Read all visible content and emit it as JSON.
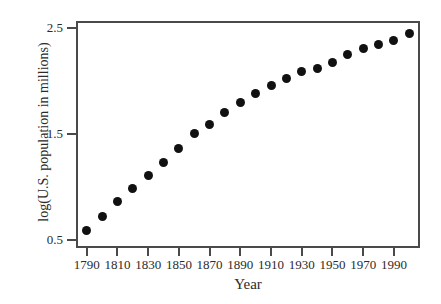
{
  "chart_data": {
    "type": "scatter",
    "title": "",
    "xlabel": "Year",
    "ylabel": "log(U.S. population in millions)",
    "xlim": [
      1783,
      2007
    ],
    "ylim": [
      0.42,
      2.57
    ],
    "grid": false,
    "legend": null,
    "marker": {
      "shape": "circle",
      "color": "#111111",
      "size_px": 9
    },
    "axis_color": "#4a4a4a",
    "background_color": "#ffffff",
    "xticks": [
      1790,
      1810,
      1830,
      1850,
      1870,
      1890,
      1910,
      1930,
      1950,
      1970,
      1990
    ],
    "xtick_labels": [
      "1790",
      "1810",
      "1830",
      "1850",
      "1870",
      "1890",
      "1910",
      "1930",
      "1950",
      "1970",
      "1990"
    ],
    "yticks": [
      0.5,
      1.5,
      2.5
    ],
    "ytick_labels": [
      "0.5",
      "1.5",
      "2.5"
    ],
    "x": [
      1790,
      1800,
      1810,
      1820,
      1830,
      1840,
      1850,
      1860,
      1870,
      1880,
      1890,
      1900,
      1910,
      1920,
      1930,
      1940,
      1950,
      1960,
      1970,
      1980,
      1990,
      2000
    ],
    "y": [
      0.59,
      0.72,
      0.86,
      0.98,
      1.11,
      1.23,
      1.36,
      1.5,
      1.59,
      1.7,
      1.8,
      1.88,
      1.96,
      2.03,
      2.09,
      2.12,
      2.18,
      2.25,
      2.31,
      2.35,
      2.39,
      2.45
    ],
    "values": [
      {
        "year": 1790,
        "log_population": 0.59
      },
      {
        "year": 1800,
        "log_population": 0.72
      },
      {
        "year": 1810,
        "log_population": 0.86
      },
      {
        "year": 1820,
        "log_population": 0.98
      },
      {
        "year": 1830,
        "log_population": 1.11
      },
      {
        "year": 1840,
        "log_population": 1.23
      },
      {
        "year": 1850,
        "log_population": 1.36
      },
      {
        "year": 1860,
        "log_population": 1.5
      },
      {
        "year": 1870,
        "log_population": 1.59
      },
      {
        "year": 1880,
        "log_population": 1.7
      },
      {
        "year": 1890,
        "log_population": 1.8
      },
      {
        "year": 1900,
        "log_population": 1.88
      },
      {
        "year": 1910,
        "log_population": 1.96
      },
      {
        "year": 1920,
        "log_population": 2.03
      },
      {
        "year": 1930,
        "log_population": 2.09
      },
      {
        "year": 1940,
        "log_population": 2.12
      },
      {
        "year": 1950,
        "log_population": 2.18
      },
      {
        "year": 1960,
        "log_population": 2.25
      },
      {
        "year": 1970,
        "log_population": 2.31
      },
      {
        "year": 1980,
        "log_population": 2.35
      },
      {
        "year": 1990,
        "log_population": 2.39
      },
      {
        "year": 2000,
        "log_population": 2.45
      }
    ]
  }
}
